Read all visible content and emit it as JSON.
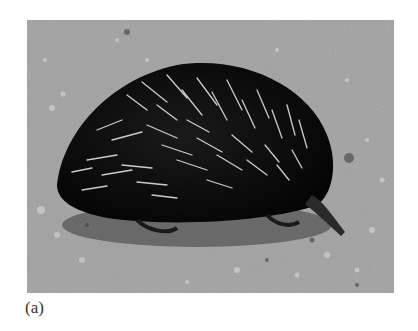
{
  "figure": {
    "caption": "(a)",
    "image_description": "Grayscale photograph of a short-beaked echidna on gravelly ground",
    "colors": {
      "ground": "#9a9a9a",
      "ground_light": "#b8b8b8",
      "ground_dark": "#6e6e6e",
      "body": "#0c0c0c",
      "spine": "#d8d8d8"
    }
  }
}
